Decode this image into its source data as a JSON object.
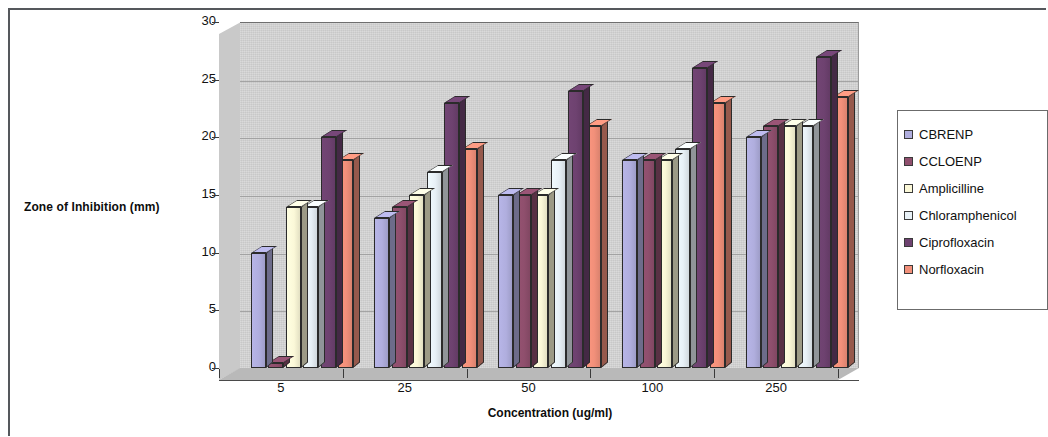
{
  "chart_data": {
    "type": "bar",
    "title": "",
    "xlabel": "Concentration (ug/ml)",
    "ylabel": "Zone of Inhibition (mm)",
    "ylim": [
      0,
      30
    ],
    "yticks": [
      0,
      5,
      10,
      15,
      20,
      25,
      30
    ],
    "grid": true,
    "legend_position": "right",
    "categories": [
      "5",
      "25",
      "50",
      "100",
      "250"
    ],
    "series": [
      {
        "name": "CBRENP",
        "color": "#b0aede",
        "values": [
          10,
          13,
          15,
          18,
          20
        ]
      },
      {
        "name": "CCLOENP",
        "color": "#8f4f6d",
        "values": [
          0.4,
          14,
          15,
          18,
          21
        ]
      },
      {
        "name": "Amplicilline",
        "color": "#fbf8d8",
        "values": [
          14,
          15,
          15,
          18,
          21
        ]
      },
      {
        "name": "Chloramphenicol",
        "color": "#e8f1f7",
        "values": [
          14,
          17,
          18,
          19,
          21
        ]
      },
      {
        "name": "Ciprofloxacin",
        "color": "#6e4270",
        "values": [
          20,
          23,
          24,
          26,
          27
        ]
      },
      {
        "name": "Norfloxacin",
        "color": "#f2907a",
        "values": [
          18,
          19,
          21,
          23,
          23.5
        ]
      }
    ]
  },
  "legend": {
    "items": [
      {
        "label": "CBRENP"
      },
      {
        "label": "CCLOENP"
      },
      {
        "label": "Amplicilline"
      },
      {
        "label": "Chloramphenicol"
      },
      {
        "label": "Ciprofloxacin"
      },
      {
        "label": "Norfloxacin"
      }
    ]
  },
  "axes": {
    "y_title": "Zone of Inhibition (mm)",
    "x_title": "Concentration (ug/ml)",
    "y_tick_labels": [
      "0",
      "5",
      "10",
      "15",
      "20",
      "25",
      "30"
    ],
    "x_tick_labels": [
      "5",
      "25",
      "50",
      "100",
      "250"
    ]
  },
  "colors": {
    "plot_background": "#d2d2d2",
    "gridline": "#9b9b9b",
    "axis": "#3a3a3a",
    "text": "#121212"
  }
}
